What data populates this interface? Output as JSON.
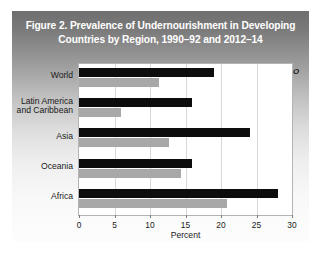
{
  "figure": {
    "title_line1": "Figure 2. Prevalence of Undernourishment in Developing",
    "title_line2": "Countries by Region, 1990–92 and 2012–14",
    "source_note": "Source: FAO",
    "panel_gradient_top": "#6f6f6f",
    "panel_gradient_bottom": "#fdfdfd",
    "title_color": "#ffffff",
    "plot_background": "#ffffff",
    "plot_border": "#b4b4b4"
  },
  "legend": {
    "position": "top-right-inside",
    "items": [
      {
        "label": "1990–92",
        "color": "#0d0d0d"
      },
      {
        "label": "2012–14",
        "color": "#a8a8a8"
      }
    ]
  },
  "chart_data": {
    "type": "bar",
    "orientation": "horizontal",
    "title": "Figure 2. Prevalence of Undernourishment in Developing Countries by Region, 1990–92 and 2012–14",
    "xlabel": "Percent",
    "ylabel": "",
    "xlim": [
      0,
      30
    ],
    "xticks": [
      0,
      5,
      10,
      15,
      20,
      25,
      30
    ],
    "xticklabels": [
      "0",
      "5",
      "10",
      "15",
      "20",
      "25",
      "30"
    ],
    "grid": true,
    "grid_axis": "x",
    "legend_position": "upper right",
    "categories": [
      "World",
      "Latin America and Caribbean",
      "Asia",
      "Oceania",
      "Africa"
    ],
    "category_label_lines": [
      [
        "World"
      ],
      [
        "Latin America",
        "and Caribbean"
      ],
      [
        "Asia"
      ],
      [
        "Oceania"
      ],
      [
        "Africa"
      ]
    ],
    "series": [
      {
        "name": "1990–92",
        "color": "#0d0d0d",
        "values": [
          19.0,
          15.9,
          24.1,
          15.9,
          28.0
        ]
      },
      {
        "name": "2012–14",
        "color": "#a8a8a8",
        "values": [
          11.3,
          5.9,
          12.7,
          14.4,
          20.8
        ]
      }
    ],
    "annotations": [
      "Source: FAO"
    ]
  }
}
